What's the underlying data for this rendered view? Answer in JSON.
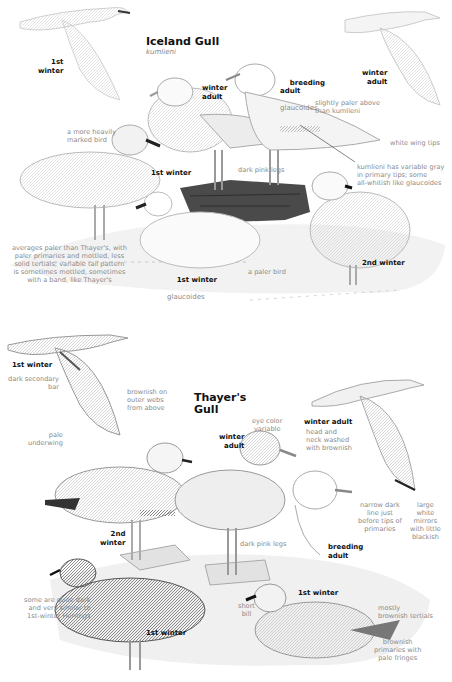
{
  "iceland": {
    "title": "Iceland Gull",
    "subspecies": "kumlieni",
    "labels": {
      "flying_1st_winter": "1st\nwinter",
      "standing_winter_adult": "winter\nadult",
      "breeding_adult": "breeding\nadult",
      "breeding_adult_ssp": "glaucoides",
      "flying_winter_adult": "winter\nadult",
      "standing_1st_winter": "1st winter",
      "resting_1st_winter": "1st winter",
      "resting_1st_winter_ssp": "glaucoides",
      "second_winter": "2nd winter"
    },
    "notes": {
      "slightly_paler": "slightly paler above\nthan kumlieni",
      "heavily_marked": "a more heavily\nmarked bird",
      "white_wing_tips": "white wing tips",
      "dark_pink_legs": "dark pink legs",
      "kumlieni_variable": "kumlieni has variable gray\nin primary tips; some\nall-whitish like glaucoides",
      "averages_paler": "averages paler than Thayer's, with\npaler primaries and mottled, less\nsolid tertials; variable tail pattern\nis sometimes mottled, sometimes\nwith a band, like Thayer's",
      "paler_bird": "a paler bird"
    }
  },
  "thayers": {
    "title": "Thayer's\nGull",
    "labels": {
      "flying_1st_winter": "1st winter",
      "winter_adult": "winter\nadult",
      "flying_winter_adult": "winter adult",
      "second_winter": "2nd\nwinter",
      "breeding_adult": "breeding\nadult",
      "resting_1st_winter": "1st winter",
      "standing_1st_winter": "1st winter"
    },
    "notes": {
      "dark_secondary_bar": "dark secondary\nbar",
      "brownish_outer_webs": "brownish on\nouter webs\nfrom above",
      "pale_underwing": "pale\nunderwing",
      "eye_color": "eye color\nvariable",
      "head_neck_washed": "head and\nneck washed\nwith brownish",
      "narrow_dark_line": "narrow dark\nline just\nbefore tips of\nprimaries",
      "large_white_mirrors": "large\nwhite\nmirrors\nwith little\nblackish",
      "dark_pink_legs": "dark pink legs",
      "quite_dark": "some are quite dark\nand very similar to\n1st-winter Herrings",
      "short_bill": "short\nbill",
      "brownish_tertials": "mostly\nbrownish tertials",
      "brownish_primaries": "brownish\nprimaries with\npale fringes"
    }
  }
}
